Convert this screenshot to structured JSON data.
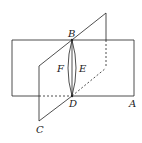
{
  "diagram": {
    "type": "geometry-two-planes",
    "labels": {
      "A": "A",
      "B": "B",
      "C": "C",
      "D": "D",
      "E": "E",
      "F": "F"
    },
    "colors": {
      "stroke": "#222222",
      "background": "#ffffff"
    }
  }
}
